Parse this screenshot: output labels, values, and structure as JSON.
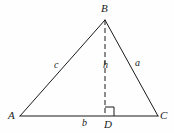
{
  "figure": {
    "type": "geometry-diagram",
    "shape": "triangle-with-altitude",
    "width": 174,
    "height": 133,
    "background_color": "#fefefe",
    "stroke_color": "#1a1a1a"
  },
  "vertices": [
    {
      "id": "A",
      "label": "A",
      "x": 20,
      "y": 116
    },
    {
      "id": "B",
      "label": "B",
      "x": 105,
      "y": 20
    },
    {
      "id": "C",
      "label": "C",
      "x": 158,
      "y": 116
    },
    {
      "id": "D",
      "label": "D",
      "x": 105,
      "y": 116
    }
  ],
  "segments": [
    {
      "id": "AB",
      "from": "A",
      "to": "B",
      "style": "solid",
      "label": "c"
    },
    {
      "id": "BC",
      "from": "B",
      "to": "C",
      "style": "solid",
      "label": "a"
    },
    {
      "id": "AC",
      "from": "A",
      "to": "C",
      "style": "solid",
      "label": "b"
    },
    {
      "id": "BD",
      "from": "B",
      "to": "D",
      "style": "dashed",
      "label": "h"
    }
  ],
  "side_labels": {
    "a": "a",
    "b": "b",
    "c": "c",
    "h": "h"
  },
  "markers": {
    "right_angle_at": "D",
    "right_angle_size": 9
  }
}
